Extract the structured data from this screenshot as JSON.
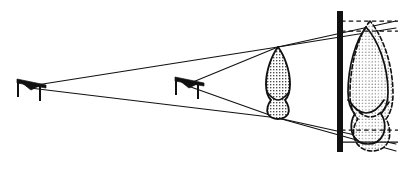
{
  "figure": {
    "background_color": "#ffffff",
    "ink_color": "#111111",
    "width": 399,
    "height": 170
  },
  "sources": [
    {
      "id": "source-far",
      "label": "distant x-ray source",
      "x": 30,
      "y": 87,
      "head": "M 16,81 L 44,81 L 44,84 L 16,84 Z",
      "cone": "M 20,84 L 40,84 L 31,91 Z",
      "post_x": 18,
      "post_y1": 80,
      "post_y2": 97,
      "arm_x1": 18,
      "arm_y1": 80,
      "arm_x2": 46,
      "arm_y2": 86,
      "stand_x": 40,
      "stand_y1": 87,
      "stand_y2": 101
    },
    {
      "id": "source-near",
      "label": "near x-ray source",
      "x": 188,
      "y": 85,
      "head": "M 174,79 L 202,79 L 202,82 L 174,82 Z",
      "cone": "M 178,82 L 198,82 L 189,89 Z",
      "post_x": 176,
      "post_y1": 78,
      "post_y2": 95,
      "arm_x1": 176,
      "arm_y1": 78,
      "arm_x2": 204,
      "arm_y2": 84,
      "stand_x": 198,
      "stand_y1": 85,
      "stand_y2": 99
    }
  ],
  "object": {
    "id": "tooth-object",
    "label": "tooth (object)",
    "apex_x": 278,
    "apex_y": 47,
    "root_x": 278,
    "root_y": 118,
    "fill_pattern": "stipple-grid",
    "outline_path": "M 278,47 C 272,55 266,70 266,84 C 266,92 268,97 271,100 C 268,104 266,110 268,114 C 270,117 274,119 278,119 C 282,119 286,117 288,114 C 290,110 288,104 285,100 C 288,97 290,92 290,84 C 290,70 284,55 278,47 Z",
    "cervix_path": "M 266,92 C 270,96 274,99 278,99 C 282,99 286,96 290,92"
  },
  "film": {
    "id": "film-plane",
    "label": "film / image receptor",
    "x": 337,
    "y_top": 11,
    "y_bottom": 152,
    "thickness": 6,
    "color": "#111111"
  },
  "projected_images": [
    {
      "id": "projection-far-source",
      "label": "image from distant source (solid outline)",
      "line_style": "solid",
      "outline_path": "M 366,27 C 356,40 348,66 348,92 C 348,103 351,110 355,114 C 351,119 350,129 353,135 C 356,141 362,144 368,144 C 374,144 380,141 383,135 C 386,129 385,119 381,114 C 385,110 388,103 388,92 C 388,66 378,40 366,27 Z",
      "cervix_path": "M 348,100 C 354,108 360,113 366,113 C 372,113 379,108 384,100"
    },
    {
      "id": "projection-near-source",
      "label": "image from near source (dashed outline, enlarged)",
      "line_style": "dashed",
      "outline_path": "M 370,21 C 358,36 350,65 350,94 C 350,106 353,114 358,119 C 353,125 352,136 356,142 C 359,148 366,151 372,151 C 379,151 385,148 388,142 C 391,136 390,125 386,119 C 390,114 393,106 393,94 C 393,65 383,36 370,21 Z",
      "cervix_path": "M 350,102 C 357,111 364,117 370,117 C 377,117 384,111 389,102"
    }
  ],
  "rays": [
    {
      "id": "ray-far-upper",
      "label": "upper ray from distant source",
      "x1": 30,
      "y1": 86,
      "x2": 278,
      "y2": 47
    },
    {
      "id": "ray-far-upper-extended",
      "label": "upper ray extended to film",
      "x1": 278,
      "y1": 47,
      "x2": 396,
      "y2": 28
    },
    {
      "id": "ray-far-lower",
      "label": "lower ray from distant source",
      "x1": 30,
      "y1": 88,
      "x2": 278,
      "y2": 118
    },
    {
      "id": "ray-far-lower-extended",
      "label": "lower ray extended to film",
      "x1": 278,
      "y1": 118,
      "x2": 396,
      "y2": 144
    },
    {
      "id": "ray-near-upper",
      "label": "upper ray from near source",
      "x1": 188,
      "y1": 84,
      "x2": 278,
      "y2": 47
    },
    {
      "id": "ray-near-upper-extended",
      "label": "upper near ray extended to film",
      "x1": 278,
      "y1": 47,
      "x2": 396,
      "y2": 21
    },
    {
      "id": "ray-near-lower",
      "label": "lower ray from near source",
      "x1": 188,
      "y1": 86,
      "x2": 278,
      "y2": 118
    },
    {
      "id": "ray-near-lower-extended",
      "label": "lower near ray extended to film",
      "x1": 278,
      "y1": 118,
      "x2": 396,
      "y2": 151
    }
  ],
  "guide_lines": [
    {
      "id": "guide-top-dashed",
      "label": "top extent of enlarged image",
      "y": 21,
      "x1": 341,
      "x2": 398,
      "style": "dashed"
    },
    {
      "id": "guide-top-solid",
      "label": "top extent of smaller image",
      "y": 31,
      "x1": 341,
      "x2": 398,
      "style": "dashed"
    },
    {
      "id": "guide-bottom-dashed",
      "label": "bottom extent of smaller image",
      "y": 130,
      "x1": 341,
      "x2": 398,
      "style": "dashed"
    },
    {
      "id": "guide-bottom-solid",
      "label": "bottom extent of enlarged image",
      "y": 142,
      "x1": 341,
      "x2": 398,
      "style": "solid"
    }
  ]
}
